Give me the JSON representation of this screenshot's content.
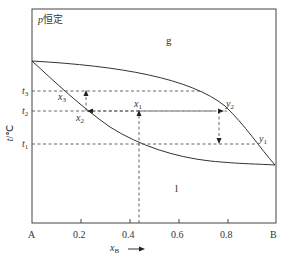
{
  "diagram": {
    "title": "p恒定",
    "title_var": "p",
    "title_text": "恒定",
    "region_gas": "g",
    "region_liquid": "l",
    "y_axis": {
      "var": "t",
      "unit": "/℃"
    },
    "x_axis": {
      "var": "x",
      "sub": "B",
      "arrow": "→"
    },
    "x_ticks": [
      "A",
      "0.2",
      "0.4",
      "0.6",
      "0.8",
      "B"
    ],
    "t_levels": [
      {
        "var": "t",
        "sub": "3"
      },
      {
        "var": "t",
        "sub": "2"
      },
      {
        "var": "t",
        "sub": "1"
      }
    ],
    "points": {
      "x3": {
        "var": "x",
        "sub": "3"
      },
      "x2": {
        "var": "x",
        "sub": "2"
      },
      "x1": {
        "var": "x",
        "sub": "1"
      },
      "y2": {
        "var": "y",
        "sub": "2"
      },
      "y1": {
        "var": "y",
        "sub": "1"
      }
    },
    "colors": {
      "line": "#333333",
      "dash": "#555555",
      "text": "#333333"
    }
  }
}
